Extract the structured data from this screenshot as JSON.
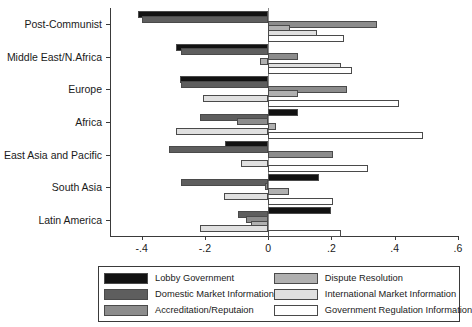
{
  "chart_data": {
    "type": "bar",
    "orientation": "horizontal",
    "title": "",
    "subtitle": "",
    "xlabel": "",
    "ylabel": "",
    "xlim": [
      -0.5,
      0.6
    ],
    "xticks": [
      -0.4,
      -0.2,
      0,
      0.2,
      0.4,
      0.6
    ],
    "xticklabels": [
      "-.4",
      "-.2",
      "0",
      ".2",
      ".4",
      ".6"
    ],
    "grid": false,
    "legend_position": "bottom",
    "zero_reference_line": true,
    "categories": [
      "Post-Communist",
      "Middle East/N.Africa",
      "Europe",
      "Africa",
      "East Asia and Pacific",
      "South Asia",
      "Latin America"
    ],
    "series": [
      {
        "name": "Lobby Government",
        "color": "#121212",
        "values": [
          -0.41,
          -0.29,
          -0.28,
          0.095,
          -0.135,
          0.16,
          0.2
        ]
      },
      {
        "name": "Domestic Market Information",
        "color": "#5e5e5e",
        "values": [
          -0.4,
          -0.275,
          -0.275,
          -0.215,
          -0.315,
          -0.275,
          -0.095
        ]
      },
      {
        "name": "Accreditation/Reputaion",
        "color": "#8c8c8c",
        "values": [
          0.345,
          0.095,
          0.25,
          -0.1,
          0.205,
          -0.01,
          -0.07
        ]
      },
      {
        "name": "Dispute Resolution",
        "color": "#b0b0b0",
        "values": [
          0.07,
          -0.025,
          0.095,
          0.025,
          0.0,
          0.065,
          -0.055
        ]
      },
      {
        "name": "International Market Information",
        "color": "#e0e0e0",
        "values": [
          0.155,
          0.23,
          -0.205,
          -0.29,
          -0.085,
          -0.14,
          -0.215
        ]
      },
      {
        "name": "Government Regulation Information",
        "color": "#ffffff",
        "values": [
          0.24,
          0.265,
          0.415,
          0.49,
          0.315,
          0.205,
          0.23
        ]
      }
    ]
  },
  "legend": {
    "items": [
      {
        "label": "Lobby Government",
        "swatch": "sw-lobby",
        "icon": "legend-swatch-black"
      },
      {
        "label": "Dispute Resolution",
        "swatch": "sw-disp",
        "icon": "legend-swatch-light-gray"
      },
      {
        "label": "Domestic Market Information",
        "swatch": "sw-dom",
        "icon": "legend-swatch-dark-gray"
      },
      {
        "label": "International Market Information",
        "swatch": "sw-intl",
        "icon": "legend-swatch-very-light-gray"
      },
      {
        "label": "Accreditation/Reputaion",
        "swatch": "sw-accr",
        "icon": "legend-swatch-mid-gray"
      },
      {
        "label": "Government Regulation Information",
        "swatch": "sw-govreg",
        "icon": "legend-swatch-white"
      }
    ]
  }
}
